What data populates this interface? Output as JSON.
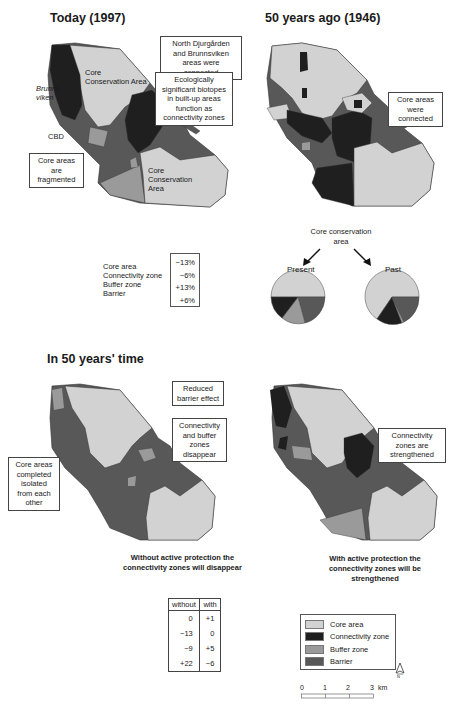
{
  "colors": {
    "core_area": "#d2d2d2",
    "connectivity_zone": "#1f1f1f",
    "buffer_zone": "#9a9a9a",
    "barrier": "#585858",
    "outline": "#333333"
  },
  "panels": {
    "today": {
      "title": "Today (1997)",
      "labels": {
        "core_conservation_area_top": "Core Conservation Area",
        "brunnsviken": "Brunns-viken",
        "cbd": "CBD",
        "vartan": "Värtan",
        "core_conservation_area_bottom": "Core Conservation Area"
      },
      "callouts": {
        "fragmented": "Core areas are fragmented",
        "biotopes": "Ecologically significant biotopes in built-up areas function as connectivity zones"
      }
    },
    "past": {
      "title": "50 years ago (1946)",
      "callouts": {
        "north_djurgarden": "North Djurgården and Brunnsviken areas were connected",
        "connected": "Core areas were connected"
      }
    },
    "future": {
      "title": "In 50 years' time",
      "callouts": {
        "reduced_barrier": "Reduced barrier effect",
        "disappear": "Connectivity and buffer zones disappear",
        "isolated": "Core areas completed isolated from each other",
        "strengthened": "Connectivity zones are strengthened"
      },
      "captions": {
        "without": "Without active protection the connectivity zones will disappear",
        "with": "With active protection the connectivity zones will be strengthened"
      }
    }
  },
  "change_table": {
    "categories": [
      "Core area",
      "Connectivity zone",
      "Buffer zone",
      "Barrier"
    ],
    "values": [
      "−13%",
      "−6%",
      "+13%",
      "+6%"
    ]
  },
  "pies": {
    "heading": "Core conservation area",
    "present_label": "Present",
    "past_label": "Past"
  },
  "comparison_table": {
    "headers": [
      "without",
      "with"
    ],
    "rows": [
      [
        "0",
        "+1"
      ],
      [
        "−13",
        "0"
      ],
      [
        "−9",
        "+5"
      ],
      [
        "+22",
        "−6"
      ]
    ]
  },
  "legend": {
    "items": [
      {
        "label": "Core area",
        "key": "core_area"
      },
      {
        "label": "Connectivity zone",
        "key": "connectivity_zone"
      },
      {
        "label": "Buffer zone",
        "key": "buffer_zone"
      },
      {
        "label": "Barrier",
        "key": "barrier"
      }
    ]
  },
  "scale_bar": {
    "ticks": [
      "0",
      "1",
      "2",
      "3"
    ],
    "unit": "km"
  },
  "north_arrow": {
    "label": "N"
  }
}
